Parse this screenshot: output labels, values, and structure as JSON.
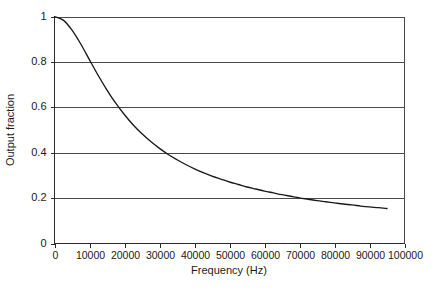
{
  "chart_data": {
    "type": "line",
    "title": "",
    "xlabel": "Frequency (Hz)",
    "ylabel": "Output fraction",
    "xlim": [
      0,
      100000
    ],
    "ylim": [
      0,
      1
    ],
    "grid": true,
    "legend": "none",
    "x_ticks": [
      0,
      10000,
      20000,
      30000,
      40000,
      50000,
      60000,
      70000,
      80000,
      90000,
      100000
    ],
    "x_tick_labels": [
      "0",
      "10000",
      "20000",
      "30000",
      "40000",
      "50000",
      "60000",
      "70000",
      "80000",
      "90000",
      "100000"
    ],
    "y_ticks": [
      0,
      0.2,
      0.4,
      0.6,
      0.8,
      1
    ],
    "y_tick_labels": [
      "0",
      "0.2",
      "0.4",
      "0.6",
      "0.8",
      "1"
    ],
    "series": [
      {
        "name": "Output fraction",
        "color": "#1a1a1a",
        "x": [
          0,
          2500,
          5000,
          7500,
          10000,
          12500,
          15000,
          17500,
          20000,
          22500,
          25000,
          27500,
          30000,
          32500,
          35000,
          37500,
          40000,
          42500,
          45000,
          47500,
          50000,
          52500,
          55000,
          57500,
          60000,
          62500,
          65000,
          67500,
          70000,
          72500,
          75000,
          77500,
          80000,
          82500,
          85000,
          87500,
          90000,
          92500,
          95000
        ],
        "values": [
          1.0,
          0.984,
          0.94,
          0.879,
          0.809,
          0.74,
          0.676,
          0.618,
          0.567,
          0.522,
          0.483,
          0.449,
          0.419,
          0.392,
          0.369,
          0.348,
          0.329,
          0.312,
          0.297,
          0.284,
          0.271,
          0.26,
          0.249,
          0.24,
          0.231,
          0.223,
          0.215,
          0.208,
          0.201,
          0.195,
          0.189,
          0.184,
          0.179,
          0.174,
          0.17,
          0.165,
          0.161,
          0.158,
          0.154
        ]
      }
    ],
    "annotations": []
  }
}
